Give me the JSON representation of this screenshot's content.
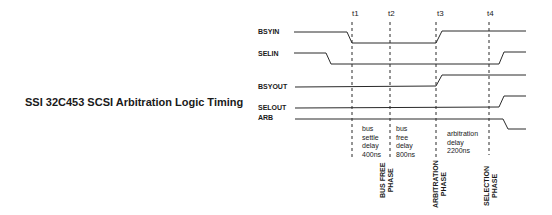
{
  "title": "SSI 32C453 SCSI Arbitration Logic Timing",
  "signals": [
    {
      "name": "BSYIN"
    },
    {
      "name": "SELIN"
    },
    {
      "name": "BSYOUT"
    },
    {
      "name": "SELOUT"
    },
    {
      "name": "ARB"
    }
  ],
  "time_markers": [
    "t1",
    "t2",
    "t3",
    "t4"
  ],
  "intervals": [
    {
      "text": "bus\nsettle\ndelay\n400ns",
      "phase": "BUS FREE\nPHASE"
    },
    {
      "text": "bus\nfree\ndelay\n800ns"
    },
    {
      "text": "arbitration\ndelay\n2200ns",
      "phase": "ARBITRATION\nPHASE"
    },
    {
      "phase": "SELECTION\nPHASE"
    }
  ],
  "colors": {
    "line": "#2a2a2a",
    "background": "#ffffff"
  }
}
